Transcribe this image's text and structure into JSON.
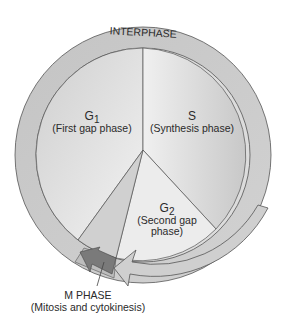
{
  "diagram": {
    "ring_label": "INTERPHASE",
    "phases": [
      {
        "id": "g1",
        "symbol": "G",
        "subscript": "1",
        "description": "(First gap phase)"
      },
      {
        "id": "s",
        "symbol": "S",
        "subscript": "",
        "description": "(Synthesis phase)"
      },
      {
        "id": "g2",
        "symbol": "G",
        "subscript": "2",
        "description_line1": "(Second gap",
        "description_line2": "phase)"
      },
      {
        "id": "m",
        "name": "M PHASE",
        "description": "(Mitosis and cytokinesis)"
      }
    ],
    "colors": {
      "ring": "#c9c9c9",
      "g1": "#d8d8d8",
      "s": "#d4d4d4",
      "g2": "#e6e6e6",
      "m_arrow": "#7d7d7d",
      "outline": "#4a4a4a"
    }
  }
}
